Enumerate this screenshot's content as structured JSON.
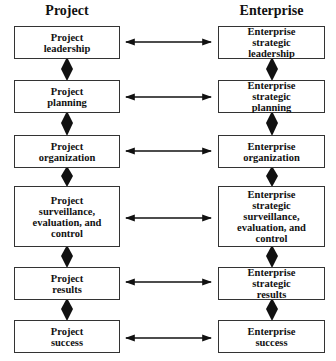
{
  "diagram": {
    "columns": {
      "left": {
        "title": "Project"
      },
      "right": {
        "title": "Enterprise"
      }
    },
    "rows": [
      {
        "left": "Project\nleadership",
        "right": "Enterprise\nstrategic\nleadership"
      },
      {
        "left": "Project\nplanning",
        "right": "Enterprise\nstrategic\nplanning"
      },
      {
        "left": "Project\norganization",
        "right": "Enterprise\norganization"
      },
      {
        "left": "Project\nsurveillance,\nevaluation, and\ncontrol",
        "right": "Enterprise\nstrategic\nsurveillance,\nevaluation, and\ncontrol"
      },
      {
        "left": "Project\nresults",
        "right": "Enterprise\nstrategic\nresults"
      },
      {
        "left": "Project\nsuccess",
        "right": "Enterprise\nsuccess"
      }
    ],
    "connectors": {
      "horizontal": "double-headed-arrow",
      "vertical": "diamond-link"
    },
    "colors": {
      "line": "#111111",
      "box_border": "#333333",
      "background": "#ffffff"
    }
  }
}
